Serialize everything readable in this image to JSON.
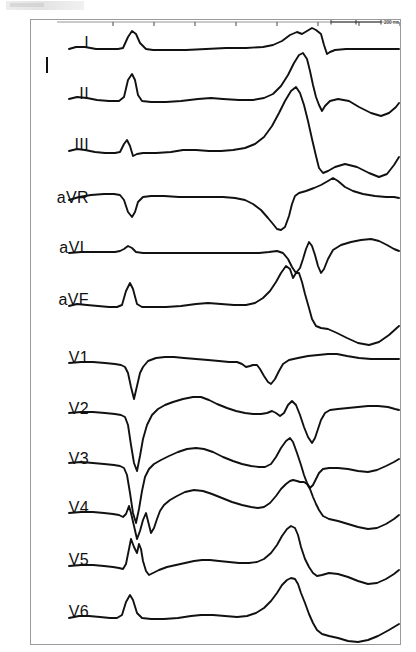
{
  "panel": {
    "background_color": "#ffffff",
    "border_color": "#9a9a9a",
    "trace_color": "#111111"
  },
  "scale": {
    "label": "200 ms",
    "tick_count": 8,
    "bar_label": "200 ms"
  },
  "leads": [
    {
      "name": "I",
      "label": "I"
    },
    {
      "name": "II",
      "label": "II"
    },
    {
      "name": "III",
      "label": "III"
    },
    {
      "name": "aVR",
      "label": "aVR"
    },
    {
      "name": "aVL",
      "label": "aVL"
    },
    {
      "name": "aVF",
      "label": "aVF"
    },
    {
      "name": "V1",
      "label": "V1"
    },
    {
      "name": "V2",
      "label": "V2"
    },
    {
      "name": "V3",
      "label": "V3"
    },
    {
      "name": "V4",
      "label": "V4"
    },
    {
      "name": "V5",
      "label": "V5"
    },
    {
      "name": "V6",
      "label": "V6"
    }
  ],
  "chart_data": {
    "type": "line",
    "title": "",
    "xlabel": "",
    "ylabel": "",
    "x_unit": "ms",
    "time_scale_label": "200 ms",
    "n_leads": 12,
    "lead_names": [
      "I",
      "II",
      "III",
      "aVR",
      "aVL",
      "aVF",
      "V1",
      "V2",
      "V3",
      "V4",
      "V5",
      "V6"
    ],
    "row_baselines_px": [
      46,
      97,
      147,
      200,
      250,
      302,
      360,
      411,
      461,
      510,
      562,
      614
    ],
    "row_pitch_px": 51,
    "plot_x_start_px": 68,
    "plot_x_end_px": 398,
    "ruler_ticks_x_px": [
      112,
      153,
      194,
      235,
      276,
      317,
      358,
      399
    ],
    "scale_bar": {
      "x_start_px": 330,
      "x_end_px": 380,
      "y_px": 21,
      "label": "200 ms"
    },
    "series": [
      {
        "name": "I",
        "points": "68,48 75,46 84,46 95,48 108,48 117,48 122,47 127,36 131,30 135,33 139,42 145,48 152,49 168,49 185,49 205,48 225,47 245,47 262,46 272,44 281,40 289,34 296,31 301,33 306,30 311,27 315,29 320,33 323,44 326,53 329,51 334,49 345,48 360,48 375,48 390,48 398,48"
      },
      {
        "name": "II",
        "points": "68,98 76,96 86,97 96,99 108,100 118,100 123,96 127,79 131,73 134,79 137,94 141,100 150,101 165,101 180,100 197,98 210,97 222,98 238,99 252,99 263,97 272,93 280,85 287,74 293,62 298,54 302,52 306,58 309,70 312,84 315,96 318,104 321,110 324,105 329,100 337,98 348,100 358,106 370,112 380,115 388,112 395,106 398,102"
      },
      {
        "name": "III",
        "points": "68,150 76,148 84,149 94,151 104,152 114,152 119,151 123,143 126,139 129,145 132,155 136,153 142,152 155,152 170,151 182,149 195,149 208,150 220,150 232,149 244,147 254,143 263,136 271,125 278,112 284,100 290,90 295,86 299,92 303,104 307,120 311,138 315,155 318,167 322,172 327,170 334,166 344,163 356,166 368,172 378,176 386,173 393,164 398,156"
      },
      {
        "name": "aVR",
        "points": "68,199 78,196 90,194 103,193 113,193 119,194 123,199 127,211 131,216 134,211 137,201 142,196 150,195 163,195 178,196 194,196 208,196 222,196 234,197 244,199 252,203 260,209 267,217 272,223 276,228 280,229 284,226 288,215 291,203 294,195 298,192 305,190 313,187 320,184 327,180 332,177 337,180 344,186 352,190 362,193 374,195 385,196 393,196 398,197"
      },
      {
        "name": "aVL",
        "points": "68,252 80,251 92,251 104,251 114,251 119,250 123,248 127,245 131,247 135,251 142,252 155,252 170,252 185,252 200,252 215,252 230,252 245,252 258,252 268,251 276,250 282,252 287,258 291,266 295,272 299,267 302,258 305,248 308,241 311,245 314,254 317,265 320,272 323,268 327,258 332,249 340,244 350,241 360,239 370,238 378,240 386,244 393,248 398,250"
      },
      {
        "name": "aVF",
        "points": "68,305 76,303 86,304 97,305 108,306 116,306 121,304 125,290 129,282 132,288 136,303 141,306 150,306 165,306 180,305 195,303 207,302 220,303 233,304 245,304 254,302 262,297 269,290 275,281 280,272 285,265 289,268 292,277 295,272 298,272 301,281 304,293 308,307 311,318 315,325 320,327 327,328 336,332 346,337 357,342 368,344 378,341 388,334 398,325"
      },
      {
        "name": "V1",
        "points": "68,362 80,361 92,361 104,362 114,363 120,364 124,366 127,372 130,386 133,398 136,385 139,372 142,366 147,360 155,357 164,356 173,356 183,357 195,358 207,359 218,360 228,361 236,361 241,363 245,366 249,365 252,364 256,364 259,368 263,375 267,381 270,383 274,378 278,370 282,363 288,359 297,357 307,355 317,354 327,353 336,353 346,355 358,357 370,358 382,358 392,358 398,358"
      },
      {
        "name": "V2",
        "points": "68,412 80,411 92,411 104,412 114,413 120,414 124,416 127,424 130,444 133,462 136,470 139,455 142,438 146,424 151,414 157,408 164,404 172,401 182,398 192,396 200,396 208,399 216,403 226,407 235,410 244,412 252,413 260,413 266,412 271,410 275,412 279,415 283,412 287,404 291,400 295,404 299,414 303,426 307,436 311,442 314,437 317,428 320,419 324,412 329,409 337,408 347,407 357,406 367,405 377,405 387,406 394,408 398,409"
      },
      {
        "name": "V3",
        "points": "68,462 80,461 92,462 103,463 113,464 119,465 123,467 126,474 129,492 132,512 135,522 138,508 141,490 144,476 148,468 153,463 160,459 168,455 177,451 186,448 195,447 203,448 212,451 222,456 232,460 241,463 250,465 258,466 264,466 270,463 275,456 280,447 285,440 289,437 292,441 296,452 300,464 303,474 306,482 309,487 312,484 315,478 318,472 322,468 328,467 337,467 347,468 357,470 367,471 376,469 385,465 393,461 398,458"
      },
      {
        "name": "V4",
        "points": "68,512 80,511 92,511 103,512 112,513 118,514 122,516 125,513 128,505 130,512 133,525 136,538 139,530 142,519 145,512 147,520 150,532 153,527 156,518 159,510 163,504 169,499 176,495 184,491 193,489 202,490 211,493 221,497 231,501 241,504 250,506 257,507 263,506 269,502 275,495 280,488 285,483 289,480 292,479 296,480 299,481 303,481 306,483 309,488 312,496 315,503 318,509 322,515 328,518 337,520 347,523 357,526 367,528 376,527 385,523 393,518 398,514"
      },
      {
        "name": "V5",
        "points": "68,565 80,564 92,564 103,565 112,566 118,567 122,568 125,563 128,548 130,538 133,546 136,552 138,543 140,548 142,560 145,570 148,574 152,572 158,569 166,566 175,564 184,562 193,560 201,559 209,559 218,560 228,561 238,562 248,562 256,561 263,558 270,552 276,544 281,535 286,528 290,525 294,527 297,534 300,546 304,558 308,566 312,572 316,575 321,574 328,572 337,573 347,576 357,580 367,583 376,582 385,578 393,573 398,569"
      },
      {
        "name": "V6",
        "points": "68,617 78,615 88,615 99,616 109,617 116,617 121,614 125,601 129,594 132,599 136,612 141,617 150,618 163,618 177,617 190,615 200,614 212,614 224,615 236,616 246,615 255,612 263,607 270,600 276,592 281,584 286,579 290,577 294,578 297,583 300,592 304,602 308,613 312,622 316,629 321,633 328,635 337,637 347,640 357,641 367,639 377,635 388,629 398,623"
      }
    ]
  }
}
